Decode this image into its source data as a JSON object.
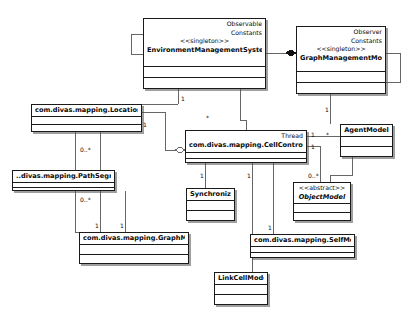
{
  "diagram": {
    "background_color": "#ffffff",
    "line_color": "#5a5a5a",
    "border_color": "#1a1a1a",
    "width": 417,
    "height": 326
  },
  "classes": [
    {
      "id": "ems",
      "supertypes": [
        "Observable",
        "Constants"
      ],
      "stereotype": "<<singleton>>",
      "name": "EnvironmentManagementSystem",
      "abstract": false,
      "x": 143,
      "y": 18,
      "w": 123,
      "h": 71,
      "header_h": 48,
      "attrs_h": 11
    },
    {
      "id": "gmm",
      "supertypes": [
        "Observer",
        "Constants"
      ],
      "stereotype": "<<singleton>>",
      "name": "GraphManagementModel",
      "abstract": false,
      "x": 296,
      "y": 26,
      "w": 90,
      "h": 68,
      "header_h": 45,
      "attrs_h": 11
    },
    {
      "id": "locationnode",
      "supertypes": [],
      "stereotype": "",
      "name": "com.divas.mapping.LocationNode",
      "abstract": false,
      "x": 31,
      "y": 104,
      "w": 111,
      "h": 28,
      "header_h": 12,
      "attrs_h": 8
    },
    {
      "id": "cellcontroller",
      "supertypes": [
        "Thread"
      ],
      "stereotype": "",
      "name": "com.divas.mapping.CellController",
      "abstract": false,
      "x": 185,
      "y": 130,
      "w": 122,
      "h": 33,
      "header_h": 22,
      "attrs_h": 6
    },
    {
      "id": "agentmodel",
      "supertypes": [],
      "stereotype": "",
      "name": "AgentModel",
      "abstract": false,
      "x": 340,
      "y": 124,
      "w": 53,
      "h": 33,
      "header_h": 12,
      "attrs_h": 10
    },
    {
      "id": "pathsegment",
      "supertypes": [],
      "stereotype": "",
      "name": "..divas.mapping.PathSegment",
      "abstract": false,
      "x": 12,
      "y": 170,
      "w": 103,
      "h": 21,
      "header_h": 12,
      "attrs_h": 5
    },
    {
      "id": "synchronizer",
      "supertypes": [],
      "stereotype": "",
      "name": "Synchronizer",
      "abstract": false,
      "x": 186,
      "y": 188,
      "w": 49,
      "h": 33,
      "header_h": 12,
      "attrs_h": 10
    },
    {
      "id": "objectmodel",
      "supertypes": [],
      "stereotype": "<<abstract>>",
      "name": "ObjectModel",
      "abstract": true,
      "x": 293,
      "y": 182,
      "w": 58,
      "h": 39,
      "header_h": 21,
      "attrs_h": 9
    },
    {
      "id": "graphmodel",
      "supertypes": [],
      "stereotype": "",
      "name": "com.divas.mapping.GraphModel",
      "abstract": false,
      "x": 79,
      "y": 232,
      "w": 110,
      "h": 32,
      "header_h": 12,
      "attrs_h": 10
    },
    {
      "id": "selfmodel",
      "supertypes": [],
      "stereotype": "",
      "name": "com.divas.mapping.SelfModel",
      "abstract": false,
      "x": 250,
      "y": 234,
      "w": 105,
      "h": 24,
      "header_h": 12,
      "attrs_h": 6
    },
    {
      "id": "linkcellmodel",
      "supertypes": [],
      "stereotype": "",
      "name": "LinkCellModel",
      "abstract": false,
      "x": 214,
      "y": 272,
      "w": 54,
      "h": 33,
      "header_h": 12,
      "attrs_h": 10
    }
  ],
  "multiplicities": [
    {
      "id": "m-ems-loc",
      "label": "1",
      "x": 181,
      "y": 95
    },
    {
      "id": "m-ems-cell",
      "label": "*",
      "x": 206,
      "y": 114
    },
    {
      "id": "m-gmm-agent",
      "label": "1",
      "x": 325,
      "y": 106
    },
    {
      "id": "m-loc-path",
      "label": "0..*",
      "x": 80,
      "y": 146
    },
    {
      "id": "m-loc-cell",
      "label": "1",
      "x": 143,
      "y": 121
    },
    {
      "id": "m-cell-agent-left",
      "label": "1",
      "x": 311,
      "y": 131
    },
    {
      "id": "m-cell-agent-right",
      "label": "*",
      "x": 326,
      "y": 131
    },
    {
      "id": "m-cell-obj-one",
      "label": "1",
      "x": 311,
      "y": 143
    },
    {
      "id": "m-path-graph",
      "label": "0..*",
      "x": 80,
      "y": 196
    },
    {
      "id": "m-cell-sync",
      "label": "1",
      "x": 200,
      "y": 172
    },
    {
      "id": "m-cell-link",
      "label": "1",
      "x": 247,
      "y": 172
    },
    {
      "id": "m-cell-obj",
      "label": "0..*",
      "x": 308,
      "y": 172
    },
    {
      "id": "m-graph-one-a",
      "label": "1",
      "x": 95,
      "y": 222
    },
    {
      "id": "m-graph-one-b",
      "label": "1",
      "x": 120,
      "y": 222
    },
    {
      "id": "m-self-one",
      "label": "1",
      "x": 268,
      "y": 224
    }
  ],
  "edges": [
    {
      "id": "edge-ems-self-loop",
      "kind": "aggregation"
    },
    {
      "id": "edge-ems-gmm",
      "kind": "association"
    },
    {
      "id": "edge-gmm-self-loop",
      "kind": "aggregation"
    },
    {
      "id": "edge-ems-locationnode",
      "kind": "association"
    },
    {
      "id": "edge-ems-cellcontroller",
      "kind": "association"
    },
    {
      "id": "edge-gmm-agentmodel",
      "kind": "association"
    },
    {
      "id": "edge-locationnode-pathsegment",
      "kind": "association"
    },
    {
      "id": "edge-locationnode-cellcontroller",
      "kind": "aggregation"
    },
    {
      "id": "edge-locationnode-graphmodel",
      "kind": "association"
    },
    {
      "id": "edge-pathsegment-graphmodel",
      "kind": "association"
    },
    {
      "id": "edge-cellcontroller-agentmodel",
      "kind": "association"
    },
    {
      "id": "edge-cellcontroller-synchronizer",
      "kind": "association"
    },
    {
      "id": "edge-cellcontroller-linkcellmodel",
      "kind": "association"
    },
    {
      "id": "edge-cellcontroller-objectmodel",
      "kind": "association"
    },
    {
      "id": "edge-cellcontroller-selfmodel",
      "kind": "association"
    },
    {
      "id": "edge-agentmodel-objectmodel",
      "kind": "association"
    }
  ]
}
